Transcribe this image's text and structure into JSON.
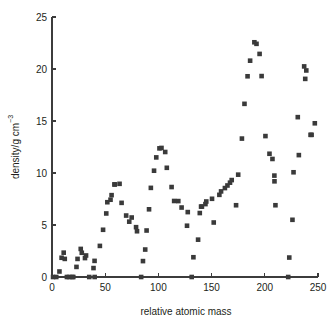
{
  "chart_data": {
    "type": "scatter",
    "title": "",
    "xlabel": "relative atomic mass",
    "ylabel_main": "density/g cm",
    "ylabel_exponent": "−3",
    "xlim": [
      0,
      250
    ],
    "ylim": [
      0,
      25
    ],
    "xticks": [
      0,
      50,
      100,
      150,
      200,
      250
    ],
    "yticks": [
      0,
      5,
      10,
      15,
      20,
      25
    ],
    "grid": false,
    "legend": "none",
    "marker": "square",
    "marker_color": "#3a3a3a",
    "marker_size_px": 4.6,
    "series": [
      {
        "name": "density",
        "points": [
          [
            1,
            0.0
          ],
          [
            4,
            0.0
          ],
          [
            7,
            0.53
          ],
          [
            9,
            1.85
          ],
          [
            11,
            2.34
          ],
          [
            12,
            1.74
          ],
          [
            14,
            0.0
          ],
          [
            16,
            0.0
          ],
          [
            19,
            0.0
          ],
          [
            20,
            0.0
          ],
          [
            23,
            0.97
          ],
          [
            24,
            1.74
          ],
          [
            27,
            2.7
          ],
          [
            28,
            2.33
          ],
          [
            31,
            1.82
          ],
          [
            32,
            2.07
          ],
          [
            35,
            0.0
          ],
          [
            39,
            0.86
          ],
          [
            40,
            1.55
          ],
          [
            40.1,
            0.0
          ],
          [
            45,
            2.99
          ],
          [
            48,
            4.54
          ],
          [
            51,
            6.11
          ],
          [
            52,
            7.19
          ],
          [
            55,
            7.43
          ],
          [
            56,
            7.87
          ],
          [
            59,
            8.9
          ],
          [
            58.7,
            8.9
          ],
          [
            63.5,
            8.96
          ],
          [
            65.4,
            7.13
          ],
          [
            69.7,
            5.91
          ],
          [
            72.6,
            5.32
          ],
          [
            74.9,
            5.72
          ],
          [
            79,
            4.79
          ],
          [
            79.9,
            4.4
          ],
          [
            83.8,
            0.0
          ],
          [
            85.5,
            1.53
          ],
          [
            87.6,
            2.64
          ],
          [
            88.9,
            4.47
          ],
          [
            91.2,
            6.51
          ],
          [
            92.9,
            8.57
          ],
          [
            95.9,
            10.22
          ],
          [
            98,
            11.5
          ],
          [
            101,
            12.37
          ],
          [
            102.9,
            12.41
          ],
          [
            106.4,
            12.02
          ],
          [
            107.9,
            10.5
          ],
          [
            112.4,
            8.65
          ],
          [
            114.8,
            7.31
          ],
          [
            118.7,
            7.3
          ],
          [
            121.8,
            6.68
          ],
          [
            127.6,
            6.24
          ],
          [
            126.9,
            4.93
          ],
          [
            131.3,
            0.0
          ],
          [
            132.9,
            1.9
          ],
          [
            137.3,
            3.59
          ],
          [
            138.9,
            6.15
          ],
          [
            140.1,
            6.77
          ],
          [
            140.9,
            6.77
          ],
          [
            144.2,
            7.01
          ],
          [
            145,
            7.26
          ],
          [
            150.4,
            7.52
          ],
          [
            152,
            5.24
          ],
          [
            157.3,
            7.9
          ],
          [
            158.9,
            8.23
          ],
          [
            162.5,
            8.55
          ],
          [
            164.9,
            8.8
          ],
          [
            167.3,
            9.07
          ],
          [
            168.9,
            9.32
          ],
          [
            173,
            6.9
          ],
          [
            175,
            9.84
          ],
          [
            178.5,
            13.31
          ],
          [
            180.9,
            16.65
          ],
          [
            183.8,
            19.3
          ],
          [
            186.2,
            20.8
          ],
          [
            190.2,
            22.57
          ],
          [
            192.2,
            22.42
          ],
          [
            195.1,
            21.45
          ],
          [
            197,
            19.32
          ],
          [
            200.6,
            13.55
          ],
          [
            204.4,
            11.85
          ],
          [
            207.2,
            11.35
          ],
          [
            209,
            9.75
          ],
          [
            209.1,
            9.2
          ],
          [
            210,
            6.9
          ],
          [
            222,
            0.0
          ],
          [
            223,
            1.87
          ],
          [
            226,
            5.5
          ],
          [
            227,
            10.07
          ],
          [
            232,
            11.72
          ],
          [
            231,
            15.37
          ],
          [
            238,
            19.05
          ],
          [
            237,
            20.25
          ],
          [
            239,
            19.86
          ],
          [
            243,
            13.67
          ],
          [
            244,
            13.67
          ],
          [
            247,
            14.78
          ]
        ]
      }
    ]
  },
  "axes": {
    "x_title": "relative atomic mass",
    "y_title_base": "density/g cm",
    "y_title_sup": "−3",
    "x_tick_labels": [
      "0",
      "50",
      "100",
      "150",
      "200",
      "250"
    ],
    "y_tick_labels": [
      "0",
      "5",
      "10",
      "15",
      "20",
      "25"
    ]
  }
}
